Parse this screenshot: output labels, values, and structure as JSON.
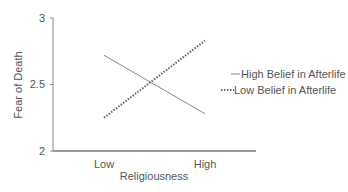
{
  "chart_data": {
    "type": "line",
    "title": "",
    "xlabel": "Religiousness",
    "ylabel": "Fear of Death",
    "categories": [
      "Low",
      "High"
    ],
    "ylim": [
      2,
      3
    ],
    "yticks": [
      "2",
      "2.5",
      "3"
    ],
    "grid": false,
    "legend_position": "right",
    "series": [
      {
        "name": "High Belief in Afterlife",
        "style": "solid",
        "values": [
          2.72,
          2.28
        ]
      },
      {
        "name": "Low Belief in Afterlife",
        "style": "dotted",
        "values": [
          2.25,
          2.83
        ]
      }
    ]
  },
  "colors": {
    "axis": "#777777",
    "text": "#555555",
    "line": "#777777"
  }
}
